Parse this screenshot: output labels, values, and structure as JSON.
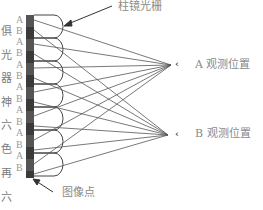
{
  "labels": {
    "lenticular": "柱镜光栅",
    "view_a": "A 观测位置",
    "view_b": "B 观测位置",
    "image_point": "图像点"
  },
  "strip_labels": [
    "A",
    "B",
    "A",
    "B",
    "A",
    "B",
    "A",
    "B",
    "A",
    "B",
    "A",
    "B",
    "A",
    "B"
  ],
  "side_text": [
    "俱",
    "光",
    "器",
    "神",
    "六",
    "色",
    "再",
    "六"
  ],
  "eye_icon": "eye-icon",
  "colors": {
    "line": "#444444",
    "strip": "#3a3a3a",
    "label": "#8a8a8a"
  }
}
